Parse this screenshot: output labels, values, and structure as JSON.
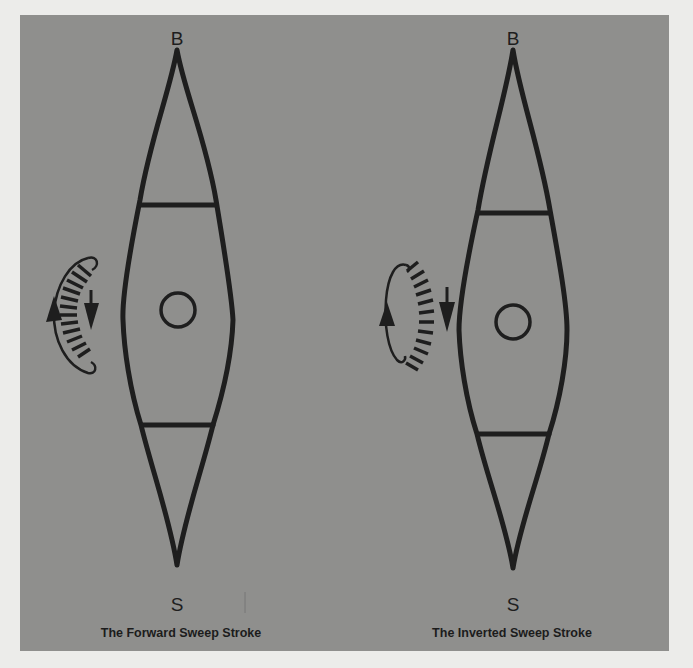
{
  "figure": {
    "left": {
      "bow_label": "B",
      "stern_label": "S",
      "caption": "The Forward Sweep Stroke",
      "stroke_direction": "forward-sweep"
    },
    "right": {
      "bow_label": "B",
      "stern_label": "S",
      "caption": "The Inverted Sweep Stroke",
      "stroke_direction": "inverted-sweep"
    }
  },
  "colors": {
    "page": "#ececea",
    "panel": "#8f8f8d",
    "ink": "#1e1e1e"
  }
}
